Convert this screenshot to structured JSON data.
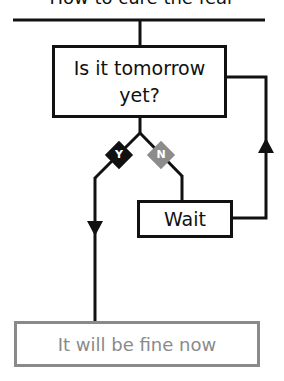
{
  "title": "How to cure the fear",
  "nodes": {
    "question": {
      "label": "Is it tomorrow yet?"
    },
    "wait": {
      "label": "Wait"
    },
    "result": {
      "label": "It will be fine now"
    }
  },
  "branches": {
    "yes": {
      "label": "Y",
      "color": "#111111"
    },
    "no": {
      "label": "N",
      "color": "#8c8c8c"
    }
  },
  "colors": {
    "line": "#111111",
    "result_border": "#8a8a8a",
    "result_text": "#8a8a8a"
  }
}
